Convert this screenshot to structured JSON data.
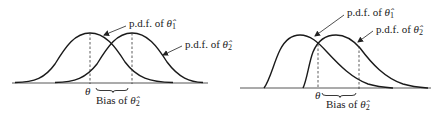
{
  "figure": {
    "panels": [
      {
        "id": "left",
        "curve1_label": {
          "prefix": "p.d.f. of ",
          "symbol": "θ̂",
          "subscript": "1"
        },
        "curve2_label": {
          "prefix": "p.d.f. of ",
          "symbol": "θ̂",
          "subscript": "2"
        },
        "axis_tick_label": "θ",
        "bias_label": {
          "prefix": "Bias of ",
          "symbol": "θ̂",
          "subscript": "2"
        }
      },
      {
        "id": "right",
        "curve1_label": {
          "prefix": "p.d.f. of ",
          "symbol": "θ̂",
          "subscript": "1"
        },
        "curve2_label": {
          "prefix": "p.d.f. of ",
          "symbol": "θ̂",
          "subscript": "2"
        },
        "axis_tick_label": "θ",
        "bias_label": {
          "prefix": "Bias of ",
          "symbol": "θ̂",
          "subscript": "2"
        }
      }
    ],
    "colors": {
      "ink": "#1a1a1a",
      "background": "#ffffff"
    }
  }
}
